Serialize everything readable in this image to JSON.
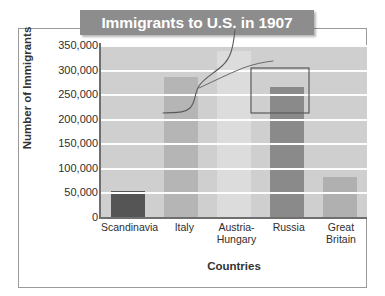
{
  "figure": {
    "title": "Immigrants to U.S. in 1907",
    "border_color": "#9a9a9a",
    "banner_color": "#8d8d8d",
    "plot_background": "#cfcfcf",
    "gridline_color": "#fdfdfd",
    "annotation_color": "#5a5a5a"
  },
  "axes": {
    "x_title": "Countries",
    "y_title": "Number of Immigrants"
  },
  "chart_data": {
    "type": "bar",
    "title": "Immigrants to U.S. in 1907",
    "xlabel": "Countries",
    "ylabel": "Number of Immigrants",
    "categories": [
      "Scandinavia",
      "Italy",
      "Austria-\nHungary",
      "Russia",
      "Great Britain"
    ],
    "values": [
      52000,
      285000,
      338000,
      265000,
      82000
    ],
    "bar_colors": [
      "#555555",
      "#b5b5b5",
      "#dcdcdc",
      "#8a8a8a",
      "#b0b0b0"
    ],
    "ylim": [
      0,
      350000
    ],
    "ytick_values": [
      0,
      50000,
      100000,
      150000,
      200000,
      250000,
      300000,
      350000
    ],
    "ytick_labels": [
      "0",
      "50,000",
      "100,000",
      "150,000",
      "200,000",
      "250,000",
      "300,000",
      "350,000"
    ],
    "grid": true,
    "grid_axis": "y",
    "legend": false,
    "annotations": [
      {
        "name": "pen-curve",
        "description": "hand drawn S curve from title down across Italy and Austria-Hungary"
      },
      {
        "name": "pen-rectangle",
        "description": "hand drawn rectangle highlighting the top of the Russia bar"
      },
      {
        "name": "pen-leader-line",
        "description": "hand drawn leader line pointing to the Russia rectangle"
      }
    ]
  }
}
